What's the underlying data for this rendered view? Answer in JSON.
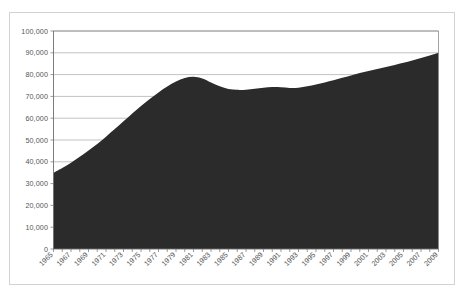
{
  "chart_data": {
    "type": "area",
    "title": "",
    "subtitle": "",
    "xlabel": "",
    "ylabel": "",
    "xlim": [
      1965,
      2009
    ],
    "ylim": [
      0,
      100000
    ],
    "grid": true,
    "legend": null,
    "series_color": "#2b2b2b",
    "y_ticks": [
      0,
      10000,
      20000,
      30000,
      40000,
      50000,
      60000,
      70000,
      80000,
      90000,
      100000
    ],
    "y_tick_labels": [
      "0",
      "10,000",
      "20,000",
      "30,000",
      "40,000",
      "50,000",
      "60,000",
      "70,000",
      "80,000",
      "90,000",
      "100,000"
    ],
    "x_tick_labels": [
      "1965",
      "1967",
      "1969",
      "1971",
      "1973",
      "1975",
      "1977",
      "1979",
      "1981",
      "1983",
      "1985",
      "1987",
      "1989",
      "1991",
      "1993",
      "1995",
      "1997",
      "1999",
      "2001",
      "2003",
      "2005",
      "2007",
      "2009"
    ],
    "x": [
      1965,
      1966,
      1967,
      1968,
      1969,
      1970,
      1971,
      1972,
      1973,
      1974,
      1975,
      1976,
      1977,
      1978,
      1979,
      1980,
      1981,
      1982,
      1983,
      1984,
      1985,
      1986,
      1987,
      1988,
      1989,
      1990,
      1991,
      1992,
      1993,
      1994,
      1995,
      1996,
      1997,
      1998,
      1999,
      2000,
      2001,
      2002,
      2003,
      2004,
      2005,
      2006,
      2007,
      2008,
      2009
    ],
    "values": [
      35000,
      37200,
      39600,
      42300,
      45200,
      48200,
      51500,
      55000,
      58600,
      62200,
      65600,
      68800,
      71800,
      74500,
      76800,
      78400,
      79000,
      78200,
      76400,
      74600,
      73400,
      73000,
      73100,
      73500,
      74000,
      74300,
      74200,
      73900,
      74000,
      74600,
      75500,
      76400,
      77400,
      78500,
      79600,
      80700,
      81700,
      82600,
      83500,
      84400,
      85400,
      86500,
      87600,
      88800,
      90000
    ]
  }
}
